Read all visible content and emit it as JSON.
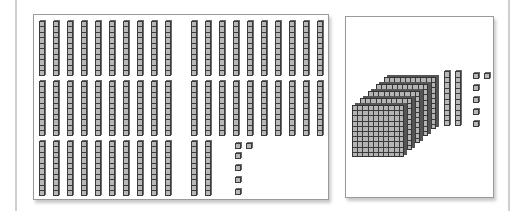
{
  "diagram": {
    "type": "base-ten-blocks",
    "colors": {
      "block_fill": "#b8b8b8",
      "block_outline": "#3a3a3a",
      "panel_border": "#9a9a9a",
      "background": "#ffffff"
    },
    "left_panel": {
      "description": "526 shown as tens rods and unit cubes",
      "tens_rods": 52,
      "rows": [
        {
          "rods": 20
        },
        {
          "rods": 20
        },
        {
          "rods": 12,
          "units": 6
        }
      ],
      "units": 6,
      "value": 526
    },
    "right_panel": {
      "description": "526 shown as hundreds flats, tens rods and unit cubes",
      "hundreds_flats": 5,
      "tens_rods": 2,
      "units": 6,
      "value": 526
    }
  }
}
